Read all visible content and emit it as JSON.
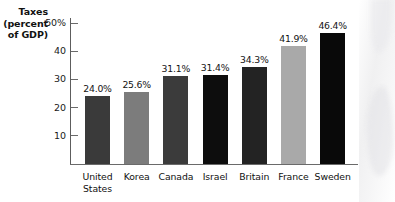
{
  "chart_data": {
    "type": "bar",
    "title": "",
    "ylabel": "Taxes (percent of GDP)",
    "ylabel_lines": [
      "Taxes",
      "(percent",
      "of GDP)"
    ],
    "xlabel": "",
    "categories": [
      "United States",
      "Korea",
      "Canada",
      "Israel",
      "Britain",
      "France",
      "Sweden"
    ],
    "category_lines": [
      [
        "United",
        "States"
      ],
      [
        "Korea"
      ],
      [
        "Canada"
      ],
      [
        "Israel"
      ],
      [
        "Britain"
      ],
      [
        "France"
      ],
      [
        "Sweden"
      ]
    ],
    "values": [
      24.0,
      25.6,
      31.1,
      31.4,
      34.3,
      41.9,
      46.4
    ],
    "value_labels": [
      "24.0%",
      "25.6%",
      "31.1%",
      "31.4%",
      "34.3%",
      "41.9%",
      "46.4%"
    ],
    "ylim": [
      0,
      50
    ],
    "yticks": [
      10,
      20,
      30,
      40,
      50
    ],
    "ytick_labels": [
      "10",
      "20",
      "30",
      "40",
      "50%"
    ],
    "grid": false,
    "legend": "none",
    "bar_colors": [
      "#3a3a3a",
      "#7c7c7c",
      "#3b3b3b",
      "#0d0d0d",
      "#232323",
      "#a9a9a9",
      "#090909"
    ]
  }
}
